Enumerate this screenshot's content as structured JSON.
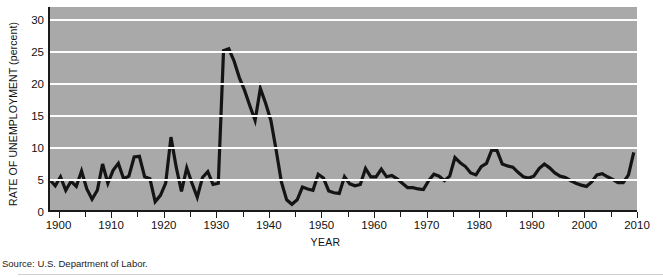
{
  "figure": {
    "source_note": "Source: U.S. Department of Labor.",
    "background_color": "#a9a9a9",
    "line_color": "#141414",
    "grid_color": "#fdfdfd"
  },
  "chart_data": {
    "type": "line",
    "title": "",
    "xlabel": "YEAR",
    "ylabel": "RATE OF UNEMPLOYMENT (percent)",
    "xlim": [
      1898,
      2010
    ],
    "ylim": [
      0,
      32
    ],
    "yticks": [
      0,
      5,
      10,
      15,
      20,
      25,
      30
    ],
    "ytick_labels": [
      "0",
      "5",
      "10",
      "15",
      "20",
      "25",
      "30"
    ],
    "xticks": [
      1900,
      1905,
      1910,
      1915,
      1920,
      1925,
      1930,
      1935,
      1940,
      1945,
      1950,
      1955,
      1960,
      1965,
      1970,
      1975,
      1980,
      1985,
      1990,
      1995,
      2000,
      2005,
      2010
    ],
    "xtick_labels_shown": [
      "1900",
      "1910",
      "1920",
      "1930",
      "1940",
      "1950",
      "1960",
      "1970",
      "1980",
      "1990",
      "2000",
      "2010"
    ],
    "grid": "horizontal",
    "legend": "none",
    "series": [
      {
        "name": "Rate of unemployment",
        "x": [
          1898,
          1899,
          1900,
          1901,
          1902,
          1903,
          1904,
          1905,
          1906,
          1907,
          1908,
          1909,
          1910,
          1911,
          1912,
          1913,
          1914,
          1915,
          1916,
          1917,
          1918,
          1919,
          1920,
          1921,
          1922,
          1923,
          1924,
          1925,
          1926,
          1927,
          1928,
          1929,
          1930,
          1931,
          1932,
          1933,
          1934,
          1935,
          1936,
          1937,
          1938,
          1939,
          1940,
          1941,
          1942,
          1943,
          1944,
          1945,
          1946,
          1947,
          1948,
          1949,
          1950,
          1951,
          1952,
          1953,
          1954,
          1955,
          1956,
          1957,
          1958,
          1959,
          1960,
          1961,
          1962,
          1963,
          1964,
          1965,
          1966,
          1967,
          1968,
          1969,
          1970,
          1971,
          1972,
          1973,
          1974,
          1975,
          1976,
          1977,
          1978,
          1979,
          1980,
          1981,
          1982,
          1983,
          1984,
          1985,
          1986,
          1987,
          1988,
          1989,
          1990,
          1991,
          1992,
          1993,
          1994,
          1995,
          1996,
          1997,
          1998,
          1999,
          2000,
          2001,
          2002,
          2003,
          2004,
          2005,
          2006,
          2007,
          2008,
          2009
        ],
        "values": [
          5.0,
          4.1,
          5.5,
          3.4,
          4.8,
          4.0,
          6.4,
          3.6,
          2.0,
          3.4,
          7.5,
          4.5,
          6.5,
          7.6,
          5.2,
          5.6,
          8.6,
          8.7,
          5.5,
          5.2,
          1.6,
          2.6,
          4.5,
          11.7,
          7.0,
          3.2,
          6.9,
          4.5,
          2.3,
          5.4,
          6.3,
          4.3,
          4.5,
          25.2,
          25.5,
          23.6,
          21.0,
          19.0,
          16.6,
          14.3,
          19.3,
          17.0,
          14.3,
          9.7,
          4.7,
          1.9,
          1.2,
          1.9,
          3.9,
          3.6,
          3.4,
          5.9,
          5.3,
          3.3,
          3.0,
          2.9,
          5.5,
          4.4,
          4.1,
          4.3,
          6.8,
          5.5,
          5.5,
          6.7,
          5.5,
          5.7,
          5.2,
          4.5,
          3.8,
          3.8,
          3.6,
          3.5,
          4.9,
          5.9,
          5.6,
          4.9,
          5.6,
          8.5,
          7.7,
          7.1,
          6.1,
          5.8,
          7.1,
          7.6,
          9.7,
          9.6,
          7.5,
          7.2,
          7.0,
          6.2,
          5.5,
          5.3,
          5.6,
          6.8,
          7.5,
          6.9,
          6.1,
          5.6,
          5.4,
          4.9,
          4.5,
          4.2,
          4.0,
          4.7,
          5.8,
          6.0,
          5.5,
          5.1,
          4.6,
          4.6,
          5.8,
          9.3
        ]
      }
    ]
  }
}
